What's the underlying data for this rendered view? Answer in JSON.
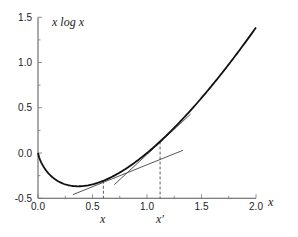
{
  "chart_data": {
    "type": "line",
    "title": "",
    "function_label": "x log x",
    "xlabel": "x",
    "ylabel": "",
    "xlim": [
      0.0,
      2.0
    ],
    "ylim": [
      -0.5,
      1.5
    ],
    "x_ticks": [
      "0.0",
      "0.5",
      "1.0",
      "1.5",
      "2.0"
    ],
    "y_ticks": [
      "-0.5",
      "0.0",
      "0.5",
      "1.0",
      "1.5"
    ],
    "grid": false,
    "legend": null,
    "series": [
      {
        "name": "x log x",
        "x": [
          0.0,
          0.05,
          0.1,
          0.2,
          0.3,
          0.368,
          0.5,
          0.6,
          0.8,
          1.0,
          1.12,
          1.25,
          1.5,
          1.75,
          2.0
        ],
        "y": [
          0.0,
          -0.15,
          -0.23,
          -0.32,
          -0.36,
          -0.368,
          -0.35,
          -0.31,
          -0.18,
          0.0,
          0.13,
          0.28,
          0.61,
          0.98,
          1.39
        ]
      }
    ],
    "tangent_lines": [
      {
        "at": "x",
        "x_value": 0.6,
        "from": [
          0.32,
          -0.46
        ],
        "to": [
          1.33,
          0.03
        ]
      },
      {
        "at": "x'",
        "x_value": 1.12,
        "from": [
          0.7,
          -0.35
        ],
        "to": [
          1.4,
          0.43
        ]
      }
    ],
    "annotations": [
      {
        "text": "x",
        "x": 0.6,
        "kind": "dashed-marker"
      },
      {
        "text": "x′",
        "x": 1.12,
        "kind": "dashed-marker"
      }
    ]
  },
  "labels": {
    "function": "x log x",
    "x_axis": "x",
    "marker_x": "x",
    "marker_x_prime": "x′"
  }
}
